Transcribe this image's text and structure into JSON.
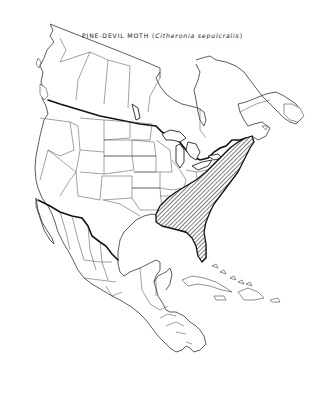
{
  "map": {
    "title_common": "PINE-DEVIL MOTH",
    "title_scientific": "Citheronia sepulcralis",
    "title_open_paren": "(",
    "title_close_paren": ")",
    "region": "North America",
    "range_pattern": "diagonal hatching",
    "range_description": "Eastern United States from Maine south along the Atlantic coast to Florida and west to eastern Texas/Louisiana",
    "colors": {
      "background": "#ffffff",
      "line": "#222222",
      "range_hatch": "#111111"
    }
  }
}
